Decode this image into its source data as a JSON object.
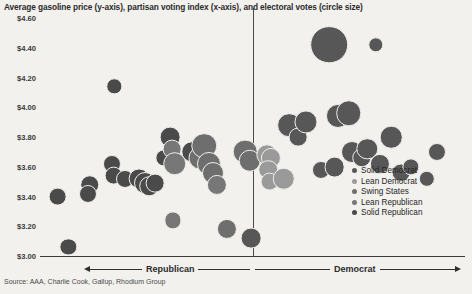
{
  "chart_data": {
    "type": "scatter",
    "title": "Average gasoline price (y-axis), partisan voting index (x-axis), and electoral votes (circle size)",
    "xlabel": "",
    "ylabel": "",
    "ylim": [
      3.0,
      4.6
    ],
    "xlim": [
      -30,
      30
    ],
    "grid": false,
    "size_encoding": "electoral votes",
    "source": "Source: AAA, Charlie Cook, Gallup, Rhodium Group",
    "y_ticks": [
      "$4.60",
      "$4.40",
      "$4.20",
      "$4.00",
      "$3.80",
      "$3.60",
      "$3.40",
      "$3.20",
      "$3.00"
    ],
    "y_tick_values": [
      4.6,
      4.4,
      4.2,
      4.0,
      3.8,
      3.6,
      3.4,
      3.2,
      3.0
    ],
    "axis_left_label": "Republican",
    "axis_right_label": "Democrat",
    "center_divider": true,
    "legend_position": "right",
    "series": [
      {
        "name": "Solid Democrat",
        "color": "#575757"
      },
      {
        "name": "Lean Democrat",
        "color": "#9a9a9a"
      },
      {
        "name": "Swing States",
        "color": "#6e6e6e"
      },
      {
        "name": "Lean Republican",
        "color": "#777777"
      },
      {
        "name": "Solid Republican",
        "color": "#4a4a4a"
      }
    ],
    "points": [
      {
        "x": -26.0,
        "y": 3.06,
        "votes": 6,
        "group": "Solid Republican"
      },
      {
        "x": -27.5,
        "y": 3.4,
        "votes": 8,
        "group": "Solid Republican"
      },
      {
        "x": -23.0,
        "y": 3.48,
        "votes": 9,
        "group": "Solid Republican"
      },
      {
        "x": -23.2,
        "y": 3.42,
        "votes": 7,
        "group": "Solid Republican"
      },
      {
        "x": -19.5,
        "y": 4.14,
        "votes": 4,
        "group": "Solid Republican"
      },
      {
        "x": -19.8,
        "y": 3.62,
        "votes": 7,
        "group": "Solid Republican"
      },
      {
        "x": -19.6,
        "y": 3.54,
        "votes": 8,
        "group": "Solid Republican"
      },
      {
        "x": -18.0,
        "y": 3.52,
        "votes": 7,
        "group": "Solid Republican"
      },
      {
        "x": -16.0,
        "y": 3.52,
        "votes": 11,
        "group": "Solid Republican"
      },
      {
        "x": -15.2,
        "y": 3.49,
        "votes": 13,
        "group": "Solid Republican"
      },
      {
        "x": -14.6,
        "y": 3.47,
        "votes": 9,
        "group": "Solid Republican"
      },
      {
        "x": -13.8,
        "y": 3.49,
        "votes": 8,
        "group": "Solid Republican"
      },
      {
        "x": -12.5,
        "y": 3.66,
        "votes": 6,
        "group": "Solid Republican"
      },
      {
        "x": -11.6,
        "y": 3.8,
        "votes": 11,
        "group": "Solid Republican"
      },
      {
        "x": -11.4,
        "y": 3.72,
        "votes": 8,
        "group": "Lean Republican"
      },
      {
        "x": -11.0,
        "y": 3.62,
        "votes": 16,
        "group": "Lean Republican"
      },
      {
        "x": -11.2,
        "y": 3.24,
        "votes": 6,
        "group": "Lean Republican"
      },
      {
        "x": -8.6,
        "y": 3.7,
        "votes": 12,
        "group": "Solid Republican"
      },
      {
        "x": -7.4,
        "y": 3.66,
        "votes": 15,
        "group": "Swing States"
      },
      {
        "x": -6.8,
        "y": 3.74,
        "votes": 20,
        "group": "Swing States"
      },
      {
        "x": -6.2,
        "y": 3.62,
        "votes": 17,
        "group": "Swing States"
      },
      {
        "x": -5.6,
        "y": 3.56,
        "votes": 13,
        "group": "Swing States"
      },
      {
        "x": -5.0,
        "y": 3.48,
        "votes": 10,
        "group": "Lean Republican"
      },
      {
        "x": -3.6,
        "y": 3.18,
        "votes": 10,
        "group": "Swing States"
      },
      {
        "x": -1.0,
        "y": 3.7,
        "votes": 18,
        "group": "Swing States"
      },
      {
        "x": -0.4,
        "y": 3.64,
        "votes": 14,
        "group": "Swing States"
      },
      {
        "x": -0.2,
        "y": 3.12,
        "votes": 11,
        "group": "Solid Democrat"
      },
      {
        "x": 2.0,
        "y": 3.68,
        "votes": 12,
        "group": "Lean Democrat"
      },
      {
        "x": 2.6,
        "y": 3.66,
        "votes": 10,
        "group": "Lean Democrat"
      },
      {
        "x": 2.2,
        "y": 3.58,
        "votes": 9,
        "group": "Lean Democrat"
      },
      {
        "x": 2.4,
        "y": 3.5,
        "votes": 8,
        "group": "Lean Democrat"
      },
      {
        "x": 4.4,
        "y": 3.52,
        "votes": 14,
        "group": "Lean Democrat"
      },
      {
        "x": 5.2,
        "y": 3.88,
        "votes": 16,
        "group": "Solid Democrat"
      },
      {
        "x": 6.4,
        "y": 3.8,
        "votes": 8,
        "group": "Solid Democrat"
      },
      {
        "x": 7.6,
        "y": 3.9,
        "votes": 15,
        "group": "Solid Democrat"
      },
      {
        "x": 9.6,
        "y": 3.58,
        "votes": 7,
        "group": "Solid Democrat"
      },
      {
        "x": 11.6,
        "y": 3.6,
        "votes": 11,
        "group": "Solid Democrat"
      },
      {
        "x": 12.0,
        "y": 3.94,
        "votes": 17,
        "group": "Solid Democrat"
      },
      {
        "x": 13.6,
        "y": 3.96,
        "votes": 20,
        "group": "Solid Democrat"
      },
      {
        "x": 14.0,
        "y": 3.7,
        "votes": 13,
        "group": "Solid Democrat"
      },
      {
        "x": 15.4,
        "y": 3.66,
        "votes": 9,
        "group": "Solid Democrat"
      },
      {
        "x": 16.2,
        "y": 3.72,
        "votes": 12,
        "group": "Solid Democrat"
      },
      {
        "x": 18.0,
        "y": 3.62,
        "votes": 10,
        "group": "Solid Democrat"
      },
      {
        "x": 19.6,
        "y": 3.8,
        "votes": 14,
        "group": "Solid Democrat"
      },
      {
        "x": 21.0,
        "y": 3.56,
        "votes": 8,
        "group": "Solid Democrat"
      },
      {
        "x": 22.4,
        "y": 3.6,
        "votes": 6,
        "group": "Solid Democrat"
      },
      {
        "x": 10.8,
        "y": 4.42,
        "votes": 55,
        "group": "Solid Democrat"
      },
      {
        "x": 17.4,
        "y": 4.42,
        "votes": 4,
        "group": "Solid Democrat"
      },
      {
        "x": 24.6,
        "y": 3.52,
        "votes": 5,
        "group": "Solid Democrat"
      },
      {
        "x": 26.0,
        "y": 3.7,
        "votes": 7,
        "group": "Solid Democrat"
      }
    ]
  }
}
